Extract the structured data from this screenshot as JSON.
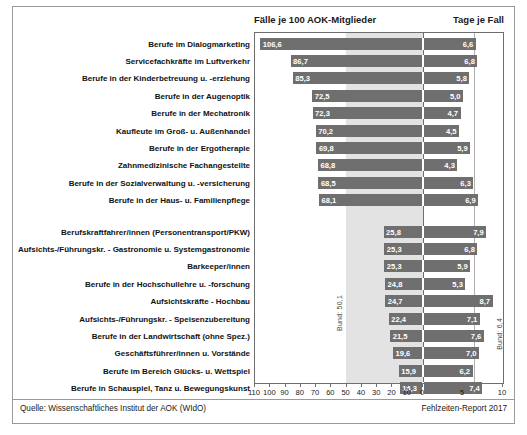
{
  "header": {
    "left_title": "Fälle je 100 AOK-Mitglieder",
    "right_title": "Tage je Fall"
  },
  "footer": {
    "source": "Quelle: Wissenschaftliches Institut der AOK (WIdO)",
    "report": "Fehlzeiten-Report 2017"
  },
  "reference": {
    "left_label": "Bund: 50,1",
    "left_value": 50.1,
    "right_label": "Bund: 6,4",
    "right_value": 6.4
  },
  "axis": {
    "left_ticks": [
      110,
      100,
      90,
      80,
      70,
      60,
      50,
      40,
      30,
      20,
      10,
      0
    ],
    "right_ticks": [
      0,
      5,
      10
    ],
    "left_max": 110,
    "right_max": 10
  },
  "chart_data": {
    "type": "bar",
    "xlabel": "",
    "ylabel": "",
    "grid": false,
    "legend": "none",
    "orientation": "horizontal",
    "panels": [
      {
        "name": "Fälle je 100 AOK-Mitglieder",
        "direction": "right-to-left",
        "xlim": [
          110,
          0
        ]
      },
      {
        "name": "Tage je Fall",
        "direction": "left-to-right",
        "xlim": [
          0,
          10
        ]
      }
    ],
    "categories": [
      "Berufe im Dialogmarketing",
      "Servicefachkräfte im Luftverkehr",
      "Berufe in der Kinderbetreuung u. -erziehung",
      "Berufe in der Augenoptik",
      "Berufe in der Mechatronik",
      "Kaufleute im Groß- u. Außenhandel",
      "Berufe in der Ergotherapie",
      "Zahnmedizinische Fachangestellte",
      "Berufe in der Sozialverwaltung u. -versicherung",
      "Berufe in der Haus- u. Familienpflege",
      "Berufskraftfahrer/innen (Personentransport/PKW)",
      "Aufsichts-/Führungskr. - Gastronomie u. Systemgastronomie",
      "Barkeeper/innen",
      "Berufe in der Hochschullehre u. -forschung",
      "Aufsichtskräfte - Hochbau",
      "Aufsichts-/Führungskr. - Speisenzubereitung",
      "Berufe in der Landwirtschaft (ohne Spez.)",
      "Geschäftsführer/innen u. Vorstände",
      "Berufe im Bereich Glücks- u. Wettspiel",
      "Berufe in Schauspiel, Tanz u. Bewegungskunst"
    ],
    "series": [
      {
        "name": "Fälle je 100 AOK-Mitglieder",
        "values": [
          106.6,
          86.7,
          85.3,
          72.5,
          72.3,
          70.2,
          69.8,
          68.8,
          68.5,
          68.1,
          25.8,
          25.3,
          25.3,
          24.8,
          24.7,
          22.4,
          21.5,
          19.6,
          15.9,
          15.3
        ],
        "labels": [
          "106,6",
          "86,7",
          "85,3",
          "72,5",
          "72,3",
          "70,2",
          "69,8",
          "68,8",
          "68,5",
          "68,1",
          "25,8",
          "25,3",
          "25,3",
          "24,8",
          "24,7",
          "22,4",
          "21,5",
          "19,6",
          "15,9",
          "15,3"
        ]
      },
      {
        "name": "Tage je Fall",
        "values": [
          6.6,
          6.8,
          5.8,
          5.0,
          4.7,
          4.5,
          5.9,
          4.3,
          6.3,
          6.9,
          7.9,
          6.8,
          5.9,
          5.3,
          8.7,
          7.1,
          7.6,
          7.0,
          6.2,
          7.4
        ],
        "labels": [
          "6,6",
          "6,8",
          "5,8",
          "5,0",
          "4,7",
          "4,5",
          "5,9",
          "4,3",
          "6,3",
          "6,9",
          "7,9",
          "6,8",
          "5,9",
          "5,3",
          "8,7",
          "7,1",
          "7,6",
          "7,0",
          "6,2",
          "7,4"
        ]
      }
    ],
    "group_break_after_index": 9,
    "colors": {
      "bar": "#6f6f6f",
      "band": "#e3e3e3",
      "frame": "#9a9a9a",
      "text": "#111111",
      "bar_label": "#ffffff"
    }
  }
}
